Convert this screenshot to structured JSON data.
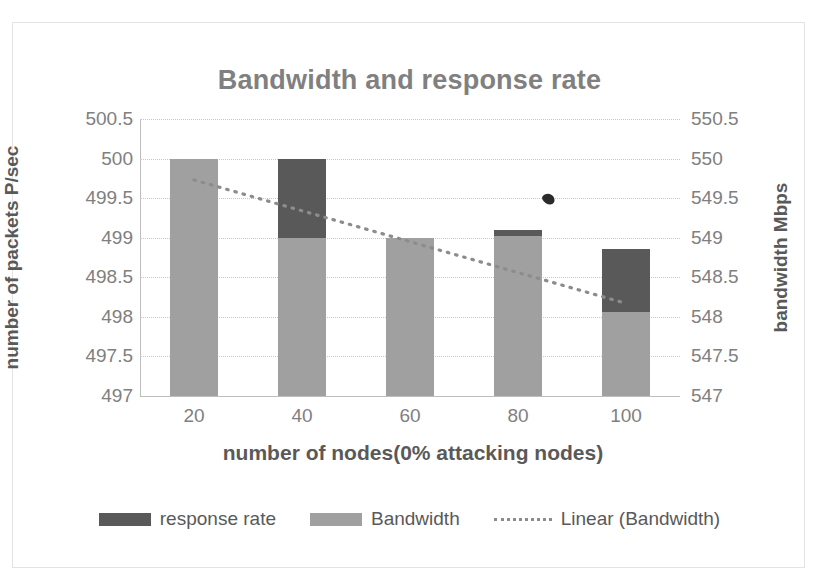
{
  "chart_data": {
    "type": "bar",
    "title": "Bandwidth and response rate",
    "xlabel": "number of nodes(0% attacking nodes)",
    "ylabel": "number of packets P/sec",
    "y2label": "bandwidth Mbps",
    "categories": [
      "20",
      "40",
      "60",
      "80",
      "100"
    ],
    "series": [
      {
        "name": "Bandwidth",
        "color": "#a0a0a0",
        "values": [
          500,
          499,
          499,
          499.02,
          498.06
        ]
      },
      {
        "name": "response rate",
        "color": "#595959",
        "values": [
          0,
          1,
          0,
          0.08,
          0.8
        ]
      },
      {
        "name": "Linear (Bandwidth)",
        "type": "trendline",
        "style": "dotted",
        "color": "#8c8c8c",
        "start": {
          "x": "20",
          "y": 499.73
        },
        "end": {
          "x": "100",
          "y": 498.17
        }
      }
    ],
    "ylim": [
      497,
      500.5
    ],
    "yticks": [
      "500.5",
      "500",
      "499.5",
      "499",
      "498.5",
      "498",
      "497.5",
      "497"
    ],
    "y2lim": [
      547,
      550.5
    ],
    "y2ticks": [
      "550.5",
      "550",
      "549.5",
      "549",
      "548.5",
      "548",
      "547.5",
      "547"
    ],
    "grid": true,
    "legend_position": "bottom",
    "stacked": true,
    "annotations": [
      {
        "name": "ink-smudge",
        "x": 0.745,
        "y": 0.272
      }
    ]
  },
  "legend": {
    "items": [
      {
        "label": "response rate",
        "swatch": "dark-gray-swatch"
      },
      {
        "label": "Bandwidth",
        "swatch": "light-gray-swatch"
      },
      {
        "label": "Linear (Bandwidth)",
        "swatch": "dotted-line-swatch"
      }
    ]
  }
}
